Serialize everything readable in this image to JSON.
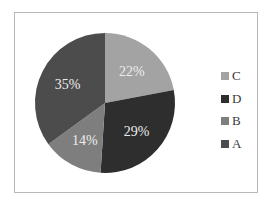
{
  "chart_data": {
    "type": "pie",
    "title": "",
    "categories": [
      "C",
      "D",
      "B",
      "A"
    ],
    "values": [
      22,
      29,
      14,
      35
    ],
    "labels": [
      "22%",
      "29%",
      "14%",
      "35%"
    ],
    "colors": [
      "#a3a3a3",
      "#2e2e2e",
      "#7e7e7e",
      "#4c4c4c"
    ],
    "start_angle": "12 o'clock",
    "direction": "clockwise",
    "legend": {
      "position": "right",
      "entries": [
        "C",
        "D",
        "B",
        "A"
      ]
    }
  },
  "legend": {
    "items": [
      {
        "label": "C",
        "color": "#a3a3a3"
      },
      {
        "label": "D",
        "color": "#2e2e2e"
      },
      {
        "label": "B",
        "color": "#7e7e7e"
      },
      {
        "label": "A",
        "color": "#4c4c4c"
      }
    ]
  }
}
